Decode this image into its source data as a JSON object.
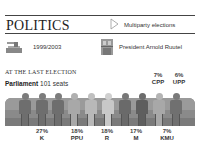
{
  "header": {
    "title": "POLITICS",
    "subtitle": "Multiparty elections",
    "arrow_icon": "triangle-right-icon"
  },
  "info": {
    "election_years": "1999/2003",
    "ballot_icon": "ballot-box-icon",
    "president": "President Arnold Ruutel",
    "president_icon": "president-building-icon"
  },
  "parliament": {
    "heading": "AT THE LAST ELECTION",
    "label": "Parliament",
    "seats": "101 seats"
  },
  "chart_data": {
    "type": "pictogram",
    "title": "AT THE LAST ELECTION",
    "subtitle": "Parliament 101 seats",
    "categories": [
      "K",
      "PPU",
      "R",
      "M",
      "KMU",
      "CPP",
      "UPP"
    ],
    "values": [
      27,
      18,
      18,
      17,
      7,
      7,
      6
    ],
    "unit": "%",
    "labels": [
      {
        "party": "K",
        "pct": "27%"
      },
      {
        "party": "PPU",
        "pct": "18%"
      },
      {
        "party": "R",
        "pct": "18%"
      },
      {
        "party": "M",
        "pct": "17%"
      },
      {
        "party": "KMU",
        "pct": "7%"
      },
      {
        "party": "CPP",
        "pct": "7%"
      },
      {
        "party": "UPP",
        "pct": "6%"
      }
    ]
  },
  "figures": [
    {
      "color": "#6e6e6e",
      "head": "#7c7c7c"
    },
    {
      "color": "#6e6e6e",
      "head": "#7c7c7c"
    },
    {
      "color": "#6e6e6e",
      "head": "#7c7c7c"
    },
    {
      "color": "#a8a8a8",
      "head": "#b0b0b0"
    },
    {
      "color": "#b8b8b8",
      "head": "#c0c0c0"
    },
    {
      "color": "#c8c8c8",
      "head": "#d0d0d0"
    },
    {
      "color": "#6a6a6a",
      "head": "#787878"
    },
    {
      "color": "#5e5e5e",
      "head": "#6c6c6c"
    },
    {
      "color": "#a8a8a8",
      "head": "#b4b4b4"
    },
    {
      "color": "#707070",
      "head": "#7a7a7a"
    }
  ]
}
